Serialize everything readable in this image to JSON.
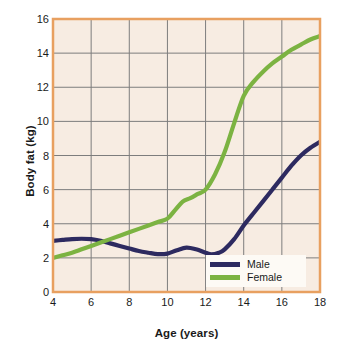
{
  "chart_data": {
    "type": "line",
    "title": "",
    "subtitle": "",
    "xlabel": "Age (years)",
    "ylabel": "Body fat (kg)",
    "xlim": [
      4,
      18
    ],
    "ylim": [
      0,
      16
    ],
    "xticks": [
      4,
      6,
      8,
      10,
      12,
      14,
      16,
      18
    ],
    "yticks": [
      0,
      2,
      4,
      6,
      8,
      10,
      12,
      14,
      16
    ],
    "xtick_labels": [
      "4",
      "6",
      "8",
      "10",
      "12",
      "14",
      "16",
      "18"
    ],
    "ytick_labels": [
      "0",
      "2",
      "4",
      "6",
      "8",
      "10",
      "12",
      "14",
      "16"
    ],
    "grid": true,
    "legend_position": "lower right",
    "series": [
      {
        "name": "Male",
        "color": "#2d2a60",
        "x": [
          4.0,
          4.5,
          5.0,
          5.5,
          6.0,
          6.5,
          7.0,
          7.5,
          8.0,
          8.5,
          9.0,
          9.5,
          10.0,
          10.5,
          11.0,
          11.5,
          12.0,
          12.3,
          12.7,
          13.0,
          13.5,
          14.0,
          14.5,
          15.0,
          15.5,
          16.0,
          16.5,
          17.0,
          17.5,
          18.0
        ],
        "y": [
          3.0,
          3.05,
          3.1,
          3.12,
          3.1,
          3.0,
          2.85,
          2.7,
          2.55,
          2.4,
          2.3,
          2.22,
          2.25,
          2.45,
          2.6,
          2.5,
          2.3,
          2.2,
          2.3,
          2.5,
          3.1,
          3.9,
          4.6,
          5.3,
          6.0,
          6.7,
          7.4,
          8.0,
          8.45,
          8.8
        ]
      },
      {
        "name": "Female",
        "color": "#7cb342",
        "x": [
          4.0,
          4.5,
          5.0,
          5.5,
          6.0,
          6.5,
          7.0,
          7.5,
          8.0,
          8.5,
          9.0,
          9.5,
          10.0,
          10.4,
          10.8,
          11.2,
          11.6,
          12.0,
          12.5,
          13.0,
          13.5,
          14.0,
          14.5,
          15.0,
          15.5,
          16.0,
          16.5,
          17.0,
          17.5,
          18.0
        ],
        "y": [
          2.0,
          2.15,
          2.3,
          2.5,
          2.7,
          2.9,
          3.1,
          3.3,
          3.5,
          3.7,
          3.9,
          4.1,
          4.3,
          4.8,
          5.3,
          5.5,
          5.75,
          6.0,
          6.9,
          8.2,
          9.9,
          11.5,
          12.3,
          12.9,
          13.4,
          13.8,
          14.2,
          14.5,
          14.8,
          15.0
        ]
      }
    ]
  },
  "style": {
    "plot_background": "#f7ece2",
    "plot_border": "#e8a060",
    "grid_color": "#7d7d7d",
    "legend_background": "#fdfaf5",
    "text_color": "#1a1a1a",
    "page_background": "#ffffff"
  },
  "legend": {
    "items": [
      {
        "label": "Male",
        "color": "#2d2a60"
      },
      {
        "label": "Female",
        "color": "#7cb342"
      }
    ]
  }
}
